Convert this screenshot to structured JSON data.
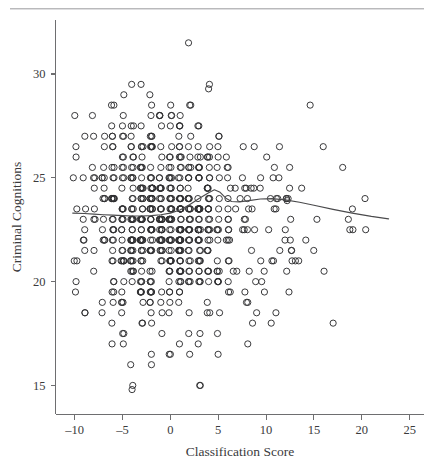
{
  "figure": {
    "kind": "scatterplot-with-loess",
    "background_color": "#ffffff",
    "ink_color": "#2f2f31",
    "rule_color": "#b9b9bb"
  },
  "chart_data": {
    "type": "scatter",
    "title": "",
    "subtitle": "",
    "xlabel": "Classification Score",
    "ylabel": "Criminal Cognitions",
    "xlim": [
      -12.0,
      26.5
    ],
    "ylim": [
      13.6,
      32.6
    ],
    "xticks": [
      -10,
      -5,
      0,
      5,
      10,
      15,
      20,
      25
    ],
    "xticklabels": [
      "–10",
      "–5",
      "0",
      "5",
      "10",
      "15",
      "20",
      "25"
    ],
    "yticks": [
      15,
      20,
      25,
      30
    ],
    "yticklabels": [
      "15",
      "20",
      "25",
      "30"
    ],
    "grid": false,
    "legend": null,
    "marker": "open-circle",
    "marker_size_px": 5.0,
    "n_points": 720,
    "series": [
      {
        "name": "Offenders",
        "note": "Dense overplotted cloud concentrated between x = -10 and x = 6, centred near y = 23; sparse tail out to x = 23.",
        "x_mean": -1.2,
        "x_sd": 4.6,
        "y_mean": 23.0,
        "y_sd": 2.7,
        "x_min": -10.2,
        "x_max": 22.6,
        "y_min": 14.8,
        "y_max": 31.5
      }
    ],
    "annotations": [
      {
        "name": "high-outlier",
        "x": 1.9,
        "y": 31.5
      },
      {
        "name": "low-outlier",
        "x": -4.0,
        "y": 14.8
      },
      {
        "name": "dark-overplotted-marker-on-curve",
        "x": 12.2,
        "y": 23.9
      }
    ],
    "smoother": {
      "name": "loess-fit",
      "visible": true,
      "points": [
        {
          "x": -10.2,
          "y": 23.3
        },
        {
          "x": -9.0,
          "y": 23.28
        },
        {
          "x": -8.0,
          "y": 23.25
        },
        {
          "x": -7.0,
          "y": 23.22
        },
        {
          "x": -6.0,
          "y": 23.2
        },
        {
          "x": -5.0,
          "y": 23.18
        },
        {
          "x": -4.0,
          "y": 23.16
        },
        {
          "x": -3.0,
          "y": 23.16
        },
        {
          "x": -2.0,
          "y": 23.18
        },
        {
          "x": -1.0,
          "y": 23.22
        },
        {
          "x": 0.0,
          "y": 23.3
        },
        {
          "x": 1.0,
          "y": 23.45
        },
        {
          "x": 2.0,
          "y": 23.7
        },
        {
          "x": 3.0,
          "y": 24.0
        },
        {
          "x": 4.0,
          "y": 24.28
        },
        {
          "x": 4.6,
          "y": 24.42
        },
        {
          "x": 5.2,
          "y": 24.3
        },
        {
          "x": 5.8,
          "y": 24.02
        },
        {
          "x": 6.4,
          "y": 23.86
        },
        {
          "x": 7.2,
          "y": 23.84
        },
        {
          "x": 8.2,
          "y": 23.9
        },
        {
          "x": 9.4,
          "y": 23.98
        },
        {
          "x": 10.6,
          "y": 24.0
        },
        {
          "x": 12.0,
          "y": 23.94
        },
        {
          "x": 13.5,
          "y": 23.82
        },
        {
          "x": 15.0,
          "y": 23.68
        },
        {
          "x": 17.0,
          "y": 23.48
        },
        {
          "x": 19.0,
          "y": 23.3
        },
        {
          "x": 21.0,
          "y": 23.14
        },
        {
          "x": 22.8,
          "y": 23.02
        }
      ]
    }
  }
}
